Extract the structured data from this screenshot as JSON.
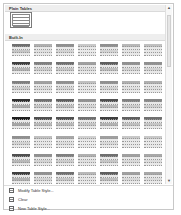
{
  "gallery": {
    "sections": [
      {
        "title": "Plain Tables",
        "top": 1
      },
      {
        "title": "Built-In",
        "top": 30
      }
    ],
    "plain_tile": {
      "name": "Table Grid",
      "style": "grid",
      "selected": true
    },
    "builtin_rows": [
      [
        "#707070",
        "#b0b0b0",
        "#909090",
        "#c8c8c8",
        "#909090",
        "#b8b8b8",
        "#c0c0c0"
      ],
      [
        "#404040",
        "#808080",
        "#707070",
        "#a0a0a0",
        "#606060",
        "#909090",
        "#909090"
      ],
      [
        "#808080",
        "#a0a0a0",
        "#909090",
        "#c0c0c0",
        "#909090",
        "#b0b0b0",
        "#b0b0b0"
      ],
      [
        "#303030",
        "#707070",
        "#606060",
        "#909090",
        "#505050",
        "#808080",
        "#888888"
      ],
      [
        "#202020",
        "#505050",
        "#505050",
        "#707070",
        "#404040",
        "#606060",
        "#707070"
      ],
      [
        "#909090",
        "#c0c0c0",
        "#a8a8a8",
        "#d0d0d0",
        "#a0a0a0",
        "#c8c8c8",
        "#c8c8c8"
      ],
      [
        "#505050",
        "#909090",
        "#808080",
        "#b0b0b0",
        "#707070",
        "#a0a0a0",
        "#a8a8a8"
      ],
      [
        "#404040",
        "#909090",
        "#707070",
        "#b8b8b8",
        "#606060",
        "#a0a0a0",
        "#a8a8a8"
      ]
    ]
  },
  "scrollbar": {
    "up": "▲",
    "down": "▼"
  },
  "menu": {
    "items": [
      {
        "label": "Modify Table Style...",
        "icon": "modify-table-style-icon"
      },
      {
        "label": "Clear",
        "icon": "clear-icon"
      },
      {
        "label": "New Table Style...",
        "icon": "new-table-style-icon"
      }
    ]
  }
}
